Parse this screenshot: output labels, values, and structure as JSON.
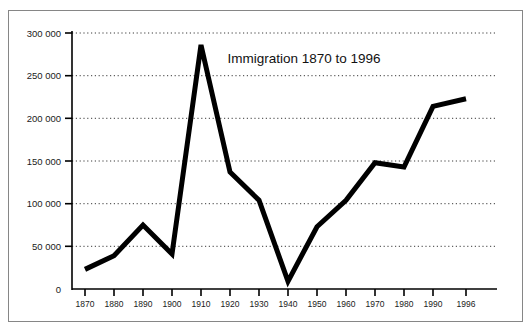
{
  "figure": {
    "frame_color": "#868686",
    "background": "#ffffff"
  },
  "chart_data": {
    "type": "line",
    "title": "Immigration 1870 to 1996",
    "xlabel": "",
    "ylabel": "",
    "x": [
      1870,
      1880,
      1890,
      1900,
      1910,
      1920,
      1930,
      1940,
      1950,
      1960,
      1970,
      1980,
      1990,
      1996
    ],
    "categories": [
      "1870",
      "1880",
      "1890",
      "1900",
      "1910",
      "1920",
      "1930",
      "1940",
      "1950",
      "1960",
      "1970",
      "1980",
      "1990",
      "1996"
    ],
    "values": [
      23000,
      39000,
      75000,
      41000,
      286000,
      137000,
      104000,
      9000,
      73000,
      104000,
      148000,
      143000,
      214000,
      223000
    ],
    "series": [
      {
        "name": "Immigration",
        "values": [
          23000,
          39000,
          75000,
          41000,
          286000,
          137000,
          104000,
          9000,
          73000,
          104000,
          148000,
          143000,
          214000,
          223000
        ],
        "color": "#000000",
        "line_width": 5
      }
    ],
    "xlim": [
      1870,
      1996
    ],
    "ylim": [
      0,
      300000
    ],
    "yticks": [
      0,
      50000,
      100000,
      150000,
      200000,
      250000,
      300000
    ],
    "ytick_labels": [
      "0",
      "50 000",
      "100 000",
      "150 000",
      "200 000",
      "250 000",
      "300 000"
    ],
    "xticks": [
      1870,
      1880,
      1890,
      1900,
      1910,
      1920,
      1930,
      1940,
      1950,
      1960,
      1970,
      1980,
      1990,
      1996
    ],
    "xtick_labels": [
      "1870",
      "1880",
      "1890",
      "1900",
      "1910",
      "1920",
      "1930",
      "1940",
      "1950",
      "1960",
      "1970",
      "1980",
      "1990",
      "1996"
    ],
    "grid": true,
    "grid_style": "dotted",
    "grid_axis": "y",
    "grid_color": "#3a3a3a",
    "legend": false,
    "legend_position": "none",
    "axis_color": "#000000",
    "title_position": "inside-top-right"
  }
}
